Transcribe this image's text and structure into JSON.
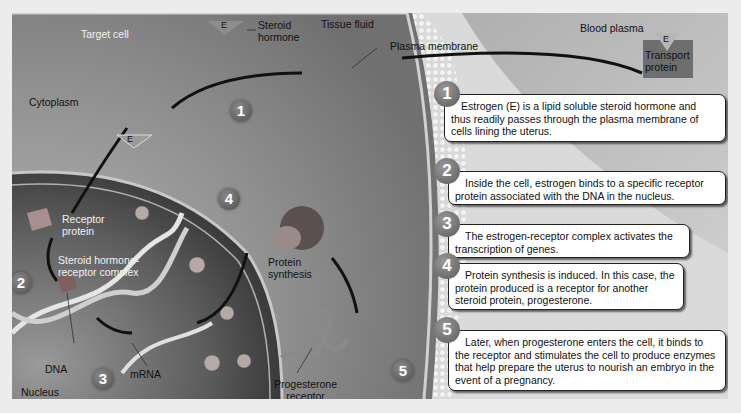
{
  "regions": {
    "target_cell": "Target cell",
    "tissue_fluid": "Tissue fluid",
    "blood_plasma": "Blood plasma",
    "cytoplasm": "Cytoplasm",
    "nucleus": "Nucleus"
  },
  "labels": {
    "steroid_hormone_line1": "Steroid",
    "steroid_hormone_line2": "hormone",
    "hormone_symbol": "E",
    "plasma_membrane": "Plasma membrane",
    "transport_protein_line1": "Transport",
    "transport_protein_line2": "protein",
    "receptor_protein_line1": "Receptor",
    "receptor_protein_line2": "protein",
    "complex_line1": "Steroid hormone-",
    "complex_line2": "receptor complex",
    "dna": "DNA",
    "mrna": "mRNA",
    "protein_synthesis_line1": "Protein",
    "protein_synthesis_line2": "synthesis",
    "progesterone_receptor_line1": "Progesterone",
    "progesterone_receptor_line2": "receptor"
  },
  "diagram_badges": [
    "1",
    "2",
    "3",
    "4",
    "5"
  ],
  "steps": [
    {
      "number": "1",
      "text": "Estrogen (E) is a lipid soluble steroid hormone and thus readily passes through the plasma membrane of cells lining the uterus."
    },
    {
      "number": "2",
      "text": "Inside the cell, estrogen binds to a specific receptor protein associated with the DNA in the nucleus."
    },
    {
      "number": "3",
      "text": "The estrogen-receptor complex activates the transcription of genes."
    },
    {
      "number": "4",
      "text": "Protein synthesis is induced. In this case, the protein produced is a receptor for another steroid protein, progesterone."
    },
    {
      "number": "5",
      "text": "Later, when progesterone enters the cell, it binds to the receptor and stimulates the cell to produce enzymes that help prepare the uterus to nourish an embryo in the event of a pregnancy."
    }
  ],
  "colors": {
    "cytoplasm": "#8a8a8a",
    "nucleus": "#5a5a5a",
    "membrane": "#e8e8e8",
    "blood_plasma": "#a9a9a9",
    "transport_protein": "#6e6e6e"
  }
}
